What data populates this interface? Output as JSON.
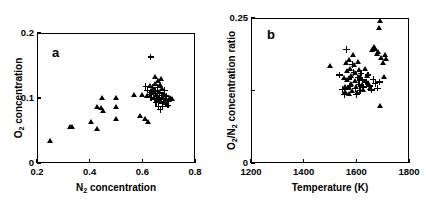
{
  "figure": {
    "background": "#ffffff",
    "ink": "#000000",
    "panels": [
      {
        "id": "a",
        "label": "a",
        "xlabel_prefix": "N",
        "xlabel_sub": "2",
        "xlabel_suffix": " concentration",
        "ylabel_prefix": "O",
        "ylabel_sub": "2",
        "ylabel_suffix": " concentration"
      },
      {
        "id": "b",
        "label": "b",
        "xlabel_prefix": "Temperature (K)",
        "xlabel_sub": "",
        "xlabel_suffix": "",
        "ylabel_prefix": "O",
        "ylabel_sub": "2",
        "ylabel_mid": "/N",
        "ylabel_sub2": "2",
        "ylabel_suffix": " concentration ratio"
      }
    ]
  },
  "chart_data": [
    {
      "type": "scatter",
      "panel": "a",
      "title": "a",
      "xlabel": "N2 concentration",
      "ylabel": "O2 concentration",
      "xlim": [
        0.2,
        0.8
      ],
      "ylim": [
        0.0,
        0.2
      ],
      "xticks": [
        0.2,
        0.4,
        0.6,
        0.8
      ],
      "xticklabels": [
        "0.2",
        "0.4",
        "0.6",
        "0.8"
      ],
      "yticks": [
        0.0,
        0.1,
        0.2
      ],
      "yticklabels": [
        "0",
        "0.1",
        "0.2"
      ],
      "grid": false,
      "legend": "none",
      "series": [
        {
          "name": "triangle",
          "marker": "triangle",
          "points": [
            [
              0.25,
              0.033
            ],
            [
              0.325,
              0.055
            ],
            [
              0.333,
              0.055
            ],
            [
              0.405,
              0.063
            ],
            [
              0.428,
              0.052
            ],
            [
              0.43,
              0.086
            ],
            [
              0.443,
              0.084
            ],
            [
              0.447,
              0.099
            ],
            [
              0.452,
              0.079
            ],
            [
              0.5,
              0.1
            ],
            [
              0.5,
              0.086
            ],
            [
              0.502,
              0.067
            ],
            [
              0.57,
              0.104
            ],
            [
              0.592,
              0.072
            ],
            [
              0.6,
              0.104
            ],
            [
              0.61,
              0.067
            ],
            [
              0.617,
              0.102
            ],
            [
              0.622,
              0.062
            ],
            [
              0.628,
              0.118
            ],
            [
              0.632,
              0.11
            ],
            [
              0.64,
              0.113
            ],
            [
              0.643,
              0.099
            ],
            [
              0.648,
              0.121
            ],
            [
              0.65,
              0.131
            ],
            [
              0.652,
              0.104
            ],
            [
              0.656,
              0.097
            ],
            [
              0.66,
              0.125
            ],
            [
              0.662,
              0.109
            ],
            [
              0.665,
              0.1
            ],
            [
              0.668,
              0.12
            ],
            [
              0.67,
              0.094
            ],
            [
              0.672,
              0.129
            ],
            [
              0.675,
              0.113
            ],
            [
              0.678,
              0.1
            ],
            [
              0.682,
              0.106
            ],
            [
              0.685,
              0.093
            ],
            [
              0.69,
              0.098
            ],
            [
              0.695,
              0.089
            ],
            [
              0.7,
              0.097
            ],
            [
              0.705,
              0.099
            ],
            [
              0.712,
              0.098
            ]
          ]
        },
        {
          "name": "plus",
          "marker": "plus",
          "points": [
            [
              0.632,
              0.163
            ],
            [
              0.613,
              0.118
            ],
            [
              0.62,
              0.112
            ],
            [
              0.627,
              0.106
            ],
            [
              0.633,
              0.101
            ],
            [
              0.638,
              0.116
            ],
            [
              0.641,
              0.107
            ],
            [
              0.645,
              0.098
            ],
            [
              0.648,
              0.111
            ],
            [
              0.652,
              0.093
            ],
            [
              0.655,
              0.103
            ],
            [
              0.658,
              0.116
            ],
            [
              0.66,
              0.087
            ],
            [
              0.663,
              0.1
            ],
            [
              0.666,
              0.108
            ],
            [
              0.668,
              0.082
            ],
            [
              0.671,
              0.095
            ],
            [
              0.674,
              0.104
            ],
            [
              0.677,
              0.087
            ],
            [
              0.68,
              0.099
            ],
            [
              0.684,
              0.112
            ],
            [
              0.688,
              0.091
            ],
            [
              0.691,
              0.103
            ],
            [
              0.697,
              0.089
            ]
          ]
        }
      ]
    },
    {
      "type": "scatter",
      "panel": "b",
      "title": "b",
      "xlabel": "Temperature (K)",
      "ylabel": "O2/N2 concentration ratio",
      "xlim": [
        1200,
        1800
      ],
      "ylim": [
        0.0,
        0.25
      ],
      "xticks": [
        1200,
        1400,
        1600,
        1800
      ],
      "xticklabels": [
        "1200",
        "1400",
        "1600",
        "1800"
      ],
      "yticks": [
        0.0,
        0.125,
        0.25
      ],
      "yticklabels": [
        "0",
        "",
        "0.25"
      ],
      "grid": false,
      "legend": "none",
      "series": [
        {
          "name": "triangle",
          "marker": "triangle",
          "points": [
            [
              1500,
              0.166
            ],
            [
              1552,
              0.146
            ],
            [
              1556,
              0.131
            ],
            [
              1558,
              0.121
            ],
            [
              1561,
              0.172
            ],
            [
              1564,
              0.158
            ],
            [
              1566,
              0.143
            ],
            [
              1569,
              0.128
            ],
            [
              1571,
              0.119
            ],
            [
              1574,
              0.177
            ],
            [
              1577,
              0.161
            ],
            [
              1580,
              0.15
            ],
            [
              1582,
              0.136
            ],
            [
              1585,
              0.124
            ],
            [
              1588,
              0.185
            ],
            [
              1591,
              0.168
            ],
            [
              1594,
              0.155
            ],
            [
              1597,
              0.141
            ],
            [
              1600,
              0.13
            ],
            [
              1603,
              0.12
            ],
            [
              1608,
              0.174
            ],
            [
              1612,
              0.159
            ],
            [
              1616,
              0.147
            ],
            [
              1620,
              0.134
            ],
            [
              1625,
              0.126
            ],
            [
              1634,
              0.162
            ],
            [
              1640,
              0.15
            ],
            [
              1646,
              0.138
            ],
            [
              1652,
              0.128
            ],
            [
              1660,
              0.194
            ],
            [
              1666,
              0.199
            ],
            [
              1672,
              0.196
            ],
            [
              1678,
              0.187
            ],
            [
              1683,
              0.19
            ],
            [
              1688,
              0.232
            ],
            [
              1690,
              0.245
            ],
            [
              1694,
              0.18
            ],
            [
              1700,
              0.172
            ],
            [
              1704,
              0.147
            ],
            [
              1710,
              0.185
            ],
            [
              1714,
              0.179
            ],
            [
              1690,
              0.097
            ]
          ]
        },
        {
          "name": "plus",
          "marker": "plus",
          "points": [
            [
              1536,
              0.152
            ],
            [
              1548,
              0.127
            ],
            [
              1554,
              0.118
            ],
            [
              1562,
              0.196
            ],
            [
              1570,
              0.145
            ],
            [
              1576,
              0.133
            ],
            [
              1584,
              0.17
            ],
            [
              1590,
              0.156
            ],
            [
              1596,
              0.128
            ],
            [
              1600,
              0.118
            ],
            [
              1606,
              0.147
            ],
            [
              1610,
              0.136
            ],
            [
              1614,
              0.125
            ],
            [
              1618,
              0.155
            ],
            [
              1622,
              0.143
            ],
            [
              1628,
              0.131
            ],
            [
              1636,
              0.14
            ],
            [
              1644,
              0.152
            ],
            [
              1650,
              0.133
            ],
            [
              1658,
              0.126
            ],
            [
              1664,
              0.144
            ],
            [
              1672,
              0.137
            ],
            [
              1680,
              0.129
            ],
            [
              1688,
              0.14
            ]
          ]
        }
      ]
    }
  ]
}
